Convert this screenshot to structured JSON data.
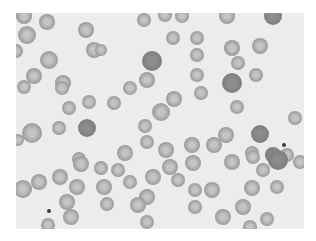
{
  "image": {
    "subject": "Blood smear micrograph showing red blood cells",
    "background_color": "#ececec",
    "frame": {
      "x": 16,
      "y": 13,
      "width": 288,
      "height": 216
    },
    "cell_color_normal": "#9a9a9a",
    "cell_color_dark": "#7e7e7e",
    "cell_center_color": "#c4c4c4",
    "cells": [
      [
        24,
        16,
        8,
        0
      ],
      [
        47,
        22,
        8,
        0
      ],
      [
        27,
        35,
        9,
        0
      ],
      [
        86,
        30,
        8,
        0
      ],
      [
        94,
        50,
        8,
        0
      ],
      [
        49,
        60,
        9,
        0
      ],
      [
        16,
        51,
        7,
        0
      ],
      [
        34,
        76,
        8,
        0
      ],
      [
        63,
        83,
        8,
        0
      ],
      [
        24,
        87,
        7,
        0
      ],
      [
        144,
        20,
        7,
        0
      ],
      [
        165,
        15,
        7,
        0
      ],
      [
        182,
        16,
        7,
        0
      ],
      [
        173,
        38,
        7,
        0
      ],
      [
        197,
        38,
        7,
        0
      ],
      [
        152,
        61,
        10,
        1
      ],
      [
        197,
        55,
        7,
        0
      ],
      [
        147,
        80,
        8,
        0
      ],
      [
        130,
        88,
        7,
        0
      ],
      [
        197,
        75,
        7,
        0
      ],
      [
        101,
        50,
        6,
        0
      ],
      [
        227,
        16,
        8,
        0
      ],
      [
        273,
        16,
        9,
        1
      ],
      [
        232,
        48,
        8,
        0
      ],
      [
        260,
        46,
        8,
        0
      ],
      [
        238,
        63,
        7,
        0
      ],
      [
        256,
        75,
        7,
        0
      ],
      [
        232,
        83,
        10,
        1
      ],
      [
        201,
        93,
        7,
        0
      ],
      [
        62,
        88,
        7,
        0
      ],
      [
        69,
        108,
        7,
        0
      ],
      [
        89,
        102,
        7,
        0
      ],
      [
        114,
        103,
        7,
        0
      ],
      [
        32,
        133,
        10,
        0
      ],
      [
        59,
        128,
        7,
        0
      ],
      [
        87,
        128,
        9,
        1
      ],
      [
        18,
        140,
        6,
        0
      ],
      [
        79,
        159,
        7,
        0
      ],
      [
        174,
        99,
        8,
        0
      ],
      [
        161,
        112,
        9,
        0
      ],
      [
        145,
        126,
        7,
        0
      ],
      [
        147,
        142,
        7,
        0
      ],
      [
        166,
        150,
        8,
        0
      ],
      [
        192,
        145,
        8,
        0
      ],
      [
        125,
        153,
        8,
        0
      ],
      [
        237,
        107,
        7,
        0
      ],
      [
        295,
        118,
        7,
        0
      ],
      [
        226,
        135,
        8,
        0
      ],
      [
        260,
        134,
        9,
        1
      ],
      [
        214,
        145,
        8,
        0
      ],
      [
        252,
        153,
        7,
        0
      ],
      [
        273,
        155,
        8,
        1
      ],
      [
        287,
        155,
        7,
        0
      ],
      [
        81,
        164,
        8,
        0
      ],
      [
        101,
        168,
        7,
        0
      ],
      [
        39,
        182,
        8,
        0
      ],
      [
        60,
        177,
        8,
        0
      ],
      [
        23,
        189,
        9,
        0
      ],
      [
        77,
        187,
        8,
        0
      ],
      [
        104,
        187,
        8,
        0
      ],
      [
        67,
        202,
        8,
        0
      ],
      [
        107,
        204,
        7,
        0
      ],
      [
        71,
        217,
        8,
        0
      ],
      [
        48,
        225,
        7,
        0
      ],
      [
        118,
        170,
        7,
        0
      ],
      [
        130,
        182,
        7,
        0
      ],
      [
        153,
        177,
        8,
        0
      ],
      [
        170,
        167,
        8,
        0
      ],
      [
        178,
        180,
        7,
        0
      ],
      [
        193,
        163,
        8,
        0
      ],
      [
        195,
        190,
        7,
        0
      ],
      [
        147,
        197,
        8,
        0
      ],
      [
        138,
        205,
        8,
        0
      ],
      [
        195,
        207,
        7,
        0
      ],
      [
        147,
        222,
        7,
        0
      ],
      [
        232,
        162,
        8,
        0
      ],
      [
        253,
        157,
        7,
        0
      ],
      [
        263,
        170,
        7,
        0
      ],
      [
        278,
        160,
        10,
        1
      ],
      [
        300,
        162,
        7,
        0
      ],
      [
        212,
        190,
        8,
        0
      ],
      [
        252,
        188,
        8,
        0
      ],
      [
        277,
        187,
        7,
        0
      ],
      [
        243,
        207,
        8,
        0
      ],
      [
        223,
        217,
        8,
        0
      ],
      [
        267,
        219,
        7,
        0
      ],
      [
        250,
        227,
        7,
        0
      ]
    ],
    "dots": [
      [
        284,
        145,
        2
      ],
      [
        49,
        211,
        2
      ]
    ]
  }
}
